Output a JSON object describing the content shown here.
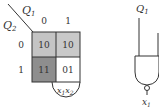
{
  "kmap": {
    "row_var": "Q",
    "row_var_sub": "2",
    "col_var": "Q",
    "col_var_sub": "1",
    "col_labels": [
      "0",
      "1"
    ],
    "row_labels": [
      "0",
      "1"
    ],
    "cells": [
      {
        "row": 0,
        "col": 0,
        "value": "10",
        "fill": "#c4c4c4"
      },
      {
        "row": 0,
        "col": 1,
        "value": "10",
        "fill": "#c9c9c9"
      },
      {
        "row": 1,
        "col": 0,
        "value": "11",
        "fill": "#8e8e8e"
      },
      {
        "row": 1,
        "col": 1,
        "value": "01",
        "fill": "#ffffff"
      }
    ],
    "loop_label_x1": "x",
    "loop_label_x1_sub": "1",
    "loop_label_x2": "x",
    "loop_label_x2_sub": "2"
  },
  "gate": {
    "input_label": "Q",
    "input_label_sub": "1",
    "output_label": "x",
    "output_label_sub": "1"
  }
}
